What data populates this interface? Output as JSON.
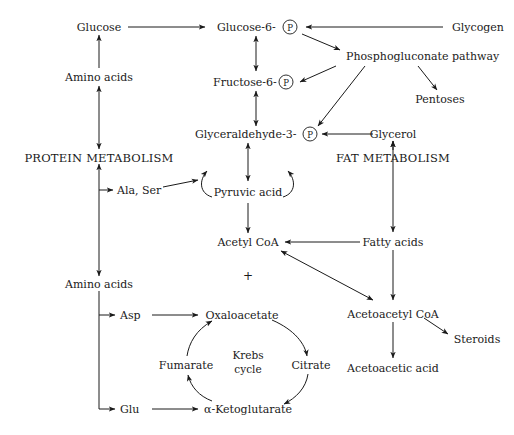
{
  "diagram": {
    "background_color": "#ffffff",
    "ink_color": "#1a1a1a",
    "nodes": {
      "glucose": "Glucose",
      "glucose6p": "Glucose-6-",
      "glycogen": "Glycogen",
      "phosphogluconate": "Phosphogluconate pathway",
      "amino_acids_top": "Amino acids",
      "fructose6p": "Fructose-6-",
      "pentoses": "Pentoses",
      "glyceraldehyde3p": "Glyceraldehyde-3-",
      "glycerol": "Glycerol",
      "protein_metabolism": "PROTEIN  METABOLISM",
      "fat_metabolism": "FAT METABOLISM",
      "ala_ser": "Ala, Ser",
      "pyruvic_acid": "Pyruvic acid",
      "acetyl_coa": "Acetyl CoA",
      "fatty_acids": "Fatty acids",
      "plus_sign": "+",
      "amino_acids_bottom": "Amino acids",
      "asp": "Asp",
      "oxaloacetate": "Oxaloacetate",
      "acetoacetyl_coa": "Acetoacetyl CoA",
      "steroids": "Steroids",
      "fumarate": "Fumarate",
      "krebs_line1": "Krebs",
      "krebs_line2": "cycle",
      "citrate": "Citrate",
      "acetoacetic_acid": "Acetoacetic acid",
      "glu": "Glu",
      "ketoglutarate": "α-Ketoglutarate",
      "phosphate_letter": "P"
    }
  }
}
